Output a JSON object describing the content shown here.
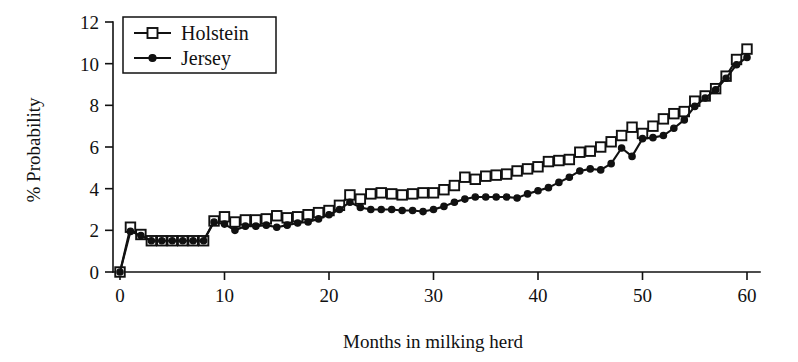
{
  "chart_data": {
    "type": "line",
    "title": "",
    "xlabel": "Months in milking herd",
    "ylabel": "% Probability",
    "xlim": [
      0,
      61
    ],
    "ylim": [
      0,
      12
    ],
    "xticks": [
      0,
      10,
      20,
      30,
      40,
      50,
      60
    ],
    "yticks": [
      0,
      2,
      4,
      6,
      8,
      10,
      12
    ],
    "grid": false,
    "legend_position": "top-left",
    "x": [
      0,
      1,
      2,
      3,
      4,
      5,
      6,
      7,
      8,
      9,
      10,
      11,
      12,
      13,
      14,
      15,
      16,
      17,
      18,
      19,
      20,
      21,
      22,
      23,
      24,
      25,
      26,
      27,
      28,
      29,
      30,
      31,
      32,
      33,
      34,
      35,
      36,
      37,
      38,
      39,
      40,
      41,
      42,
      43,
      44,
      45,
      46,
      47,
      48,
      49,
      50,
      51,
      52,
      53,
      54,
      55,
      56,
      57,
      58,
      59,
      60
    ],
    "series": [
      {
        "name": "Holstein",
        "marker": "open-square",
        "values": [
          0.0,
          2.15,
          1.8,
          1.5,
          1.5,
          1.5,
          1.5,
          1.5,
          1.5,
          2.45,
          2.65,
          2.4,
          2.5,
          2.5,
          2.55,
          2.7,
          2.6,
          2.65,
          2.75,
          2.85,
          2.95,
          3.2,
          3.7,
          3.5,
          3.75,
          3.8,
          3.75,
          3.7,
          3.75,
          3.8,
          3.8,
          3.95,
          4.15,
          4.55,
          4.45,
          4.6,
          4.65,
          4.7,
          4.85,
          4.95,
          5.05,
          5.3,
          5.35,
          5.4,
          5.75,
          5.8,
          6.0,
          6.25,
          6.55,
          6.95,
          6.65,
          7.0,
          7.35,
          7.6,
          7.7,
          8.2,
          8.45,
          8.8,
          9.4,
          10.2,
          10.7
        ]
      },
      {
        "name": "Jersey",
        "marker": "filled-circle",
        "values": [
          0.0,
          1.95,
          1.75,
          1.5,
          1.5,
          1.5,
          1.5,
          1.5,
          1.5,
          2.4,
          2.3,
          2.0,
          2.2,
          2.2,
          2.25,
          2.15,
          2.25,
          2.35,
          2.4,
          2.55,
          2.75,
          3.0,
          3.35,
          3.1,
          3.0,
          3.0,
          3.0,
          2.95,
          2.95,
          2.9,
          3.0,
          3.15,
          3.35,
          3.5,
          3.6,
          3.6,
          3.6,
          3.6,
          3.55,
          3.75,
          3.9,
          4.05,
          4.3,
          4.55,
          4.85,
          4.95,
          4.9,
          5.2,
          5.95,
          5.55,
          6.4,
          6.45,
          6.55,
          6.9,
          7.3,
          7.95,
          8.35,
          8.75,
          9.3,
          9.95,
          10.3
        ]
      }
    ]
  },
  "legend": {
    "items": [
      {
        "label": "Holstein",
        "marker": "open-square"
      },
      {
        "label": "Jersey",
        "marker": "filled-circle"
      }
    ]
  },
  "colors": {
    "ink": "#111111",
    "background": "#ffffff"
  }
}
